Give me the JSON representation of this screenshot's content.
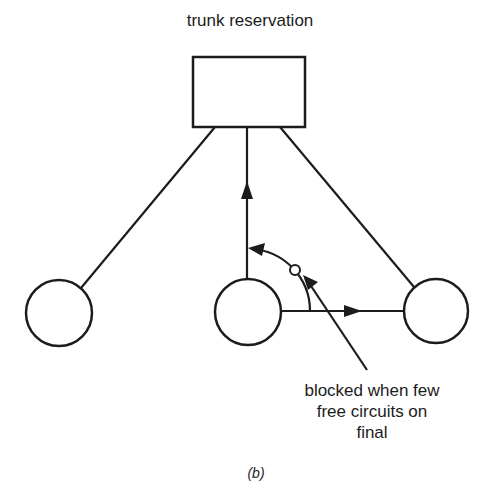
{
  "diagram": {
    "title": "trunk reservation",
    "annotation_lines": [
      "blocked when few",
      "free circuits on",
      "final"
    ],
    "caption": "(b)",
    "nodes": [
      {
        "id": "trunk-reservation-box",
        "shape": "rectangle"
      },
      {
        "id": "left-node",
        "shape": "circle"
      },
      {
        "id": "middle-node",
        "shape": "circle"
      },
      {
        "id": "right-node",
        "shape": "circle"
      }
    ],
    "edges": [
      {
        "from": "left-node",
        "to": "trunk-reservation-box",
        "directed": false
      },
      {
        "from": "middle-node",
        "to": "trunk-reservation-box",
        "directed": true
      },
      {
        "from": "right-node",
        "to": "trunk-reservation-box",
        "directed": false
      },
      {
        "from": "middle-node",
        "to": "right-node",
        "directed": true
      }
    ],
    "colors": {
      "stroke": "#1c1c1c",
      "background": "#ffffff"
    }
  }
}
